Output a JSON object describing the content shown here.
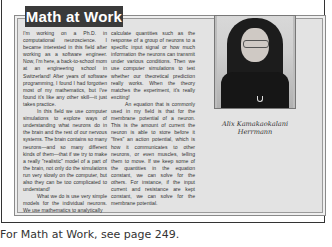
{
  "sidebar_box": {
    "title": "Math at Work",
    "column1": [
      "I'm working on a Ph.D. in computational neuroscience. I became interested in this field after working as a software engineer. Now, I'm here, a back-to-school mom at an engineering school in Switzerland! After years of software programming, I found I had forgotten most of my mathematics, but I've found it's like any other skill—it just takes practice.",
      "In this field we use computer simulations to explore ways of understanding what neurons do in the brain and the rest of our nervous systems. The brain contains so many neurons—and so many different kinds of them—that if we try to make a really \"realistic\" model of a part of the brain, not only do the simulations run very slowly on the computer, but also they can be too complicated to understand!",
      "What we do is use very simple models for the individual neurons. We use mathematics to analytically"
    ],
    "column2": [
      "calculate quantities such as the response of a group of neurons to a specific input signal or how much information the neurons can transmit under various conditions. Then we use computer simulations to test whether our theoretical prediction really works. When the theory matches the experiment, it's really exciting!",
      "An equation that is commonly used in my field is that for the membrane potential of a neuron. This is the amount of current the neuron is able to store before it \"fires\" an action potential, which is how it communicates to other neurons, or even muscles, telling them to move. If we keep some of the quantities in the equation constant, we can solve for the others. For instance, if the input current and resistance are kept constant, we can solve for the membrane potential."
    ],
    "photo_caption_line1": "Alix Kamakaokalani",
    "photo_caption_line2": "Herrmann"
  },
  "footer": {
    "text": "For Math at Work, see page 249."
  }
}
